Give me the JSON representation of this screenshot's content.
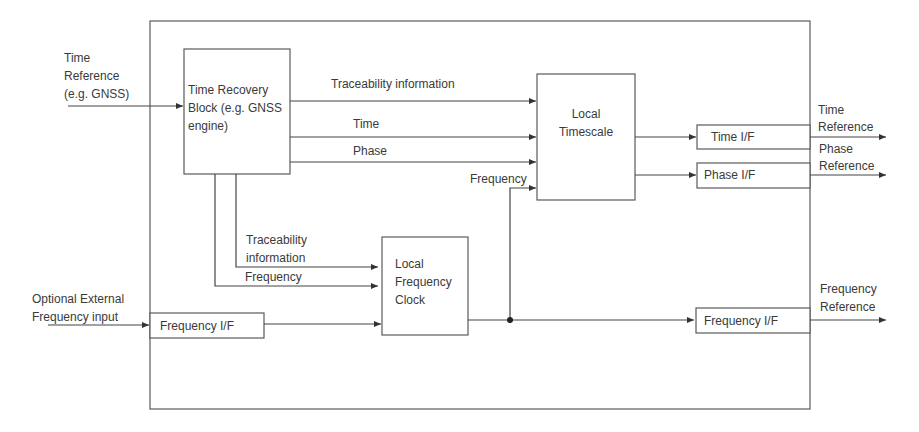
{
  "diagram": {
    "colors": {
      "line": "#444444",
      "box_border": "#5a5a5a",
      "text": "#3a3a3a",
      "background": "#ffffff"
    },
    "inputs": {
      "time_reference": [
        "Time",
        "Reference",
        "(e.g. GNSS)"
      ],
      "optional_external": [
        "Optional External",
        "Frequency  input"
      ]
    },
    "blocks": {
      "time_recovery": [
        "Time Recovery",
        "Block (e.g. GNSS",
        "engine)"
      ],
      "local_timescale": [
        "Local",
        "Timescale"
      ],
      "local_frequency_clock": [
        "Local",
        "Frequency",
        "Clock"
      ],
      "time_if": "Time I/F",
      "phase_if": "Phase I/F",
      "frequency_if_out": "Frequency I/F",
      "frequency_if_in": "Frequency I/F"
    },
    "signals": {
      "traceability_top": "Traceability information",
      "time": "Time",
      "phase": "Phase",
      "frequency_to_timescale": "Frequency",
      "traceability_lower": [
        "Traceability",
        "information"
      ],
      "frequency_lower": "Frequency"
    },
    "outputs": {
      "time_reference": [
        "Time",
        "Reference"
      ],
      "phase_reference": [
        "Phase",
        "Reference"
      ],
      "frequency_reference": [
        "Frequency",
        "Reference"
      ]
    }
  }
}
